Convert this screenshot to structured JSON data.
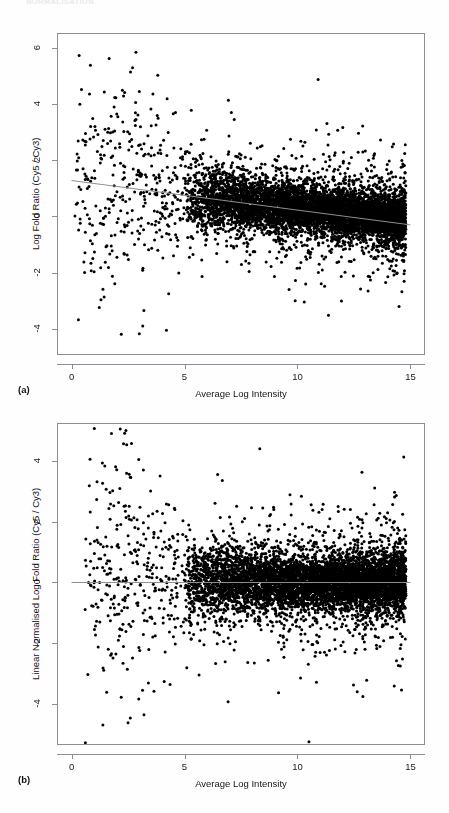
{
  "page": {
    "width": 449,
    "height": 813,
    "background": "#fefefe",
    "running_header": "NORMALISATION"
  },
  "figure": {
    "panels": [
      {
        "label": "(a)",
        "xlabel": "Average Log Intensity",
        "ylabel": "Log Fold Ratio (Cy5 / Cy3)",
        "xticks": [
          "0",
          "5",
          "10",
          "15"
        ],
        "yticks": [
          "6",
          "4",
          "2",
          "0",
          "-2",
          "-4"
        ]
      },
      {
        "label": "(b)",
        "xlabel": "Average Log Intensity",
        "ylabel": "Linear Normalised Log Fold Ratio (Cy5 / Cy3)",
        "xticks": [
          "0",
          "5",
          "10",
          "15"
        ],
        "yticks": [
          "4",
          "2",
          "0",
          "-2",
          "-4"
        ]
      }
    ]
  },
  "chart_data": [
    {
      "type": "scatter",
      "panel": "(a)",
      "title": "",
      "xlabel": "Average Log Intensity",
      "ylabel": "Log Fold Ratio (Cy5 / Cy3)",
      "xlim": [
        -0.6,
        15.6
      ],
      "ylim": [
        -4.9,
        6.5
      ],
      "xticks": [
        0,
        5,
        10,
        15
      ],
      "yticks": [
        6,
        4,
        2,
        0,
        -2,
        -4
      ],
      "grid": false,
      "legend": "none",
      "marker": {
        "shape": "circle",
        "color": "#000000",
        "size_px": 3
      },
      "annotation": "MA plot before normalisation; log fold ratios show intensity-dependent bias",
      "trend_line": {
        "type": "loess-fit",
        "color": "#8e8e92",
        "x_start": 0,
        "y_start": 1.28,
        "x_end": 15,
        "y_end": -0.3
      },
      "cloud": {
        "description": "dense band of ~5000 spots, tight above x=5, fanning out below x=5",
        "n_points": 5200,
        "dense_core": {
          "x_range": [
            5.0,
            14.8
          ],
          "y_center_at_x5": 0.72,
          "y_center_at_x15": -0.12,
          "y_spread": 0.4
        },
        "sparse_tail": {
          "x_range": [
            0.2,
            5.0
          ],
          "y_range": [
            -4.3,
            5.9
          ],
          "n_points": 330
        }
      },
      "outliers": [
        {
          "x": 2.85,
          "y": 5.85
        },
        {
          "x": 2.7,
          "y": 5.3
        },
        {
          "x": 2.25,
          "y": 4.5
        },
        {
          "x": 2.35,
          "y": 4.42
        },
        {
          "x": 3.0,
          "y": 4.45
        },
        {
          "x": 2.0,
          "y": 3.65
        },
        {
          "x": 2.05,
          "y": 3.55
        },
        {
          "x": 2.85,
          "y": 3.45
        },
        {
          "x": 3.05,
          "y": 3.2
        },
        {
          "x": 1.6,
          "y": 3.0
        },
        {
          "x": 4.6,
          "y": 3.7
        },
        {
          "x": 5.3,
          "y": 3.78
        },
        {
          "x": 7.2,
          "y": 3.45
        },
        {
          "x": 0.15,
          "y": 0.02
        },
        {
          "x": 0.7,
          "y": 1.0
        },
        {
          "x": 1.0,
          "y": -1.97
        },
        {
          "x": 2.2,
          "y": -4.2
        },
        {
          "x": 3.0,
          "y": -4.18
        },
        {
          "x": 4.2,
          "y": -4.05
        },
        {
          "x": 3.15,
          "y": -3.9
        },
        {
          "x": 3.2,
          "y": -3.35
        },
        {
          "x": 4.3,
          "y": -2.75
        },
        {
          "x": 9.9,
          "y": -3.0
        },
        {
          "x": 10.3,
          "y": -3.05
        },
        {
          "x": 11.05,
          "y": -2.4
        },
        {
          "x": 13.2,
          "y": -2.15
        },
        {
          "x": 14.0,
          "y": -2.15
        }
      ]
    },
    {
      "type": "scatter",
      "panel": "(b)",
      "title": "",
      "xlabel": "Average Log Intensity",
      "ylabel": "Linear Normalised Log Fold Ratio (Cy5 / Cy3)",
      "xlim": [
        -0.6,
        15.6
      ],
      "ylim": [
        -5.3,
        5.2
      ],
      "xticks": [
        0,
        5,
        10,
        15
      ],
      "yticks": [
        4,
        2,
        0,
        -2,
        -4
      ],
      "grid": false,
      "legend": "none",
      "marker": {
        "shape": "circle",
        "color": "#000000",
        "size_px": 3
      },
      "annotation": "MA plot after linear normalisation; cloud centred on zero",
      "trend_line": {
        "type": "zero-reference",
        "color": "#8e8e92",
        "x_start": 0,
        "y_start": 0.0,
        "x_end": 15,
        "y_end": 0.0
      },
      "cloud": {
        "description": "dense band of ~5000 spots centred on y=0 across full intensity range",
        "n_points": 5200,
        "dense_core": {
          "x_range": [
            5.0,
            14.8
          ],
          "y_center_at_x5": 0.05,
          "y_center_at_x15": 0.0,
          "y_spread": 0.42
        },
        "sparse_tail": {
          "x_range": [
            0.6,
            5.0
          ],
          "y_range": [
            -4.6,
            4.9
          ],
          "n_points": 320
        }
      },
      "outliers": [
        {
          "x": 2.35,
          "y": 4.9
        },
        {
          "x": 2.3,
          "y": 4.55
        },
        {
          "x": 1.95,
          "y": 3.8
        },
        {
          "x": 2.0,
          "y": 3.7
        },
        {
          "x": 2.55,
          "y": 3.55
        },
        {
          "x": 2.6,
          "y": 3.45
        },
        {
          "x": 1.7,
          "y": 2.95
        },
        {
          "x": 3.5,
          "y": 3.0
        },
        {
          "x": 4.3,
          "y": 2.55
        },
        {
          "x": 6.35,
          "y": 2.6
        },
        {
          "x": 0.75,
          "y": 0.0
        },
        {
          "x": 1.25,
          "y": -1.3
        },
        {
          "x": 2.5,
          "y": -4.6
        },
        {
          "x": 2.6,
          "y": -4.45
        },
        {
          "x": 3.4,
          "y": -3.3
        },
        {
          "x": 4.1,
          "y": -3.25
        },
        {
          "x": 5.1,
          "y": -2.8
        },
        {
          "x": 6.8,
          "y": -2.6
        },
        {
          "x": 9.4,
          "y": -2.45
        },
        {
          "x": 11.0,
          "y": -2.3
        },
        {
          "x": 12.6,
          "y": -2.2
        }
      ]
    }
  ]
}
